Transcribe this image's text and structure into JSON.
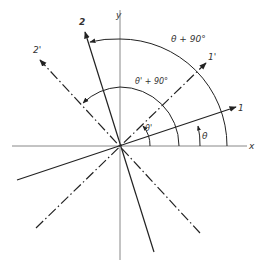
{
  "diagram": {
    "axes": {
      "x_label": "x",
      "y_label": "y"
    },
    "lines": {
      "line_1": {
        "label": "1",
        "style": "solid"
      },
      "line_1_prime": {
        "label": "1'",
        "style": "dash-dot"
      },
      "line_2": {
        "label": "2",
        "style": "solid"
      },
      "line_2_prime": {
        "label": "2'",
        "style": "dash-dot"
      }
    },
    "angles": {
      "theta": "θ",
      "theta_prime": "θ'",
      "theta_plus_90": "θ + 90°",
      "theta_prime_plus_90": "θ' + 90°"
    },
    "colors": {
      "line": "#222222",
      "axis": "#888888",
      "background": "#ffffff"
    }
  }
}
